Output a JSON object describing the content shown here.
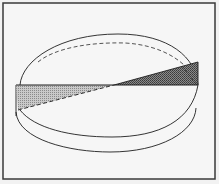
{
  "figure": {
    "colors": {
      "background": "#f2f2f2",
      "frame": "#3a3a3a",
      "line": "#1e1e1e",
      "dashed": "#2a2a2a",
      "shade_left": "#b8b8b8",
      "shade_right": "#6e6e6e"
    },
    "frame": {
      "x": 3,
      "y": 3,
      "width": 212,
      "height": 177
    },
    "horizontal_line": {
      "x1": 16,
      "y1": 85,
      "x2": 198,
      "y2": 85
    },
    "center": {
      "x": 114,
      "y": 85
    },
    "left_triangle": {
      "points": "16,85 114,85 18,110"
    },
    "right_triangle": {
      "points": "114,85 198,62 198,85"
    },
    "dashed_diagonal": {
      "x1": 18,
      "y1": 110,
      "x2": 198,
      "y2": 62
    }
  }
}
